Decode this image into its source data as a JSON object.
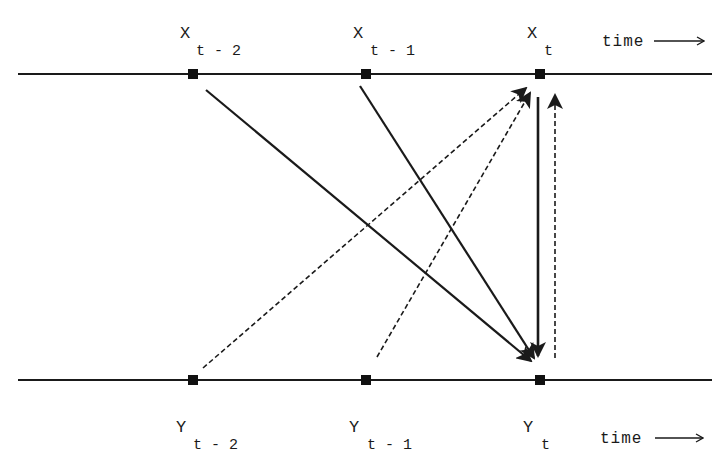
{
  "diagram": {
    "type": "causal-time-series",
    "top_series": {
      "name": "X",
      "nodes": [
        {
          "label": "X",
          "subscript": "t-2"
        },
        {
          "label": "X",
          "subscript": "t-1"
        },
        {
          "label": "X",
          "subscript": "t"
        }
      ],
      "time_label": "time"
    },
    "bottom_series": {
      "name": "Y",
      "nodes": [
        {
          "label": "Y",
          "subscript": "t-2"
        },
        {
          "label": "Y",
          "subscript": "t-1"
        },
        {
          "label": "Y",
          "subscript": "t"
        }
      ],
      "time_label": "time"
    },
    "edges": [
      {
        "from": "X_t-2",
        "to": "Y_t",
        "style": "solid"
      },
      {
        "from": "X_t-1",
        "to": "Y_t",
        "style": "solid"
      },
      {
        "from": "X_t",
        "to": "Y_t",
        "style": "solid"
      },
      {
        "from": "Y_t-2",
        "to": "X_t",
        "style": "dashed"
      },
      {
        "from": "Y_t-1",
        "to": "X_t",
        "style": "dashed"
      },
      {
        "from": "Y_t",
        "to": "X_t",
        "style": "dashed"
      }
    ],
    "colors": {
      "line": "#1a1a1a",
      "background": "#ffffff"
    }
  },
  "labels": {
    "x_main": "X",
    "y_main": "Y",
    "sub_t2": "t - 2",
    "sub_t1": "t - 1",
    "sub_t": "t",
    "time": "time"
  }
}
